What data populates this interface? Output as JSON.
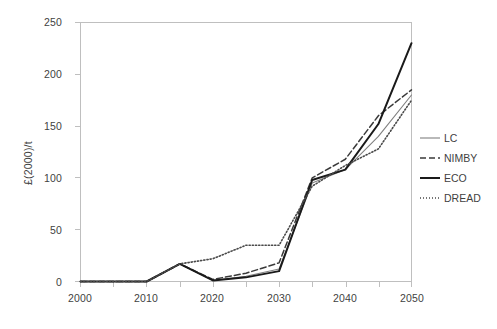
{
  "chart_data": {
    "type": "line",
    "title": "",
    "xlabel": "",
    "ylabel": "£(2000)/t",
    "xlim": [
      2000,
      2050
    ],
    "ylim": [
      0,
      250
    ],
    "xticks": [
      2000,
      2010,
      2020,
      2030,
      2040,
      2050
    ],
    "yticks": [
      0,
      50,
      100,
      150,
      200,
      250
    ],
    "xtick_labels": [
      "2000",
      "2010",
      "2020",
      "2030",
      "2040",
      "2050"
    ],
    "ytick_labels": [
      "0",
      "50",
      "100",
      "150",
      "200",
      "250"
    ],
    "grid": false,
    "legend_position": "right",
    "x": [
      2000,
      2005,
      2010,
      2015,
      2020,
      2025,
      2030,
      2035,
      2040,
      2045,
      2050
    ],
    "series": [
      {
        "name": "LC",
        "style": "solid-thin",
        "color": "#808080",
        "values": [
          0,
          0,
          0,
          17,
          1,
          5,
          12,
          95,
          108,
          140,
          180
        ]
      },
      {
        "name": "NIMBY",
        "style": "dashed",
        "color": "#3a3a3a",
        "values": [
          0,
          0,
          0,
          17,
          2,
          8,
          18,
          100,
          118,
          160,
          185
        ]
      },
      {
        "name": "ECO",
        "style": "solid-thick",
        "color": "#1a1a1a",
        "values": [
          0,
          0,
          0,
          17,
          1,
          4,
          10,
          98,
          108,
          152,
          230
        ]
      },
      {
        "name": "DREAD",
        "style": "dotted",
        "color": "#4a4a4a",
        "values": [
          0,
          0,
          0,
          17,
          22,
          35,
          35,
          92,
          112,
          128,
          175
        ]
      }
    ]
  },
  "legend": {
    "items": [
      {
        "label": "LC"
      },
      {
        "label": "NIMBY"
      },
      {
        "label": "ECO"
      },
      {
        "label": "DREAD"
      }
    ]
  },
  "axes": {
    "y_title": "£(2000)/t"
  }
}
